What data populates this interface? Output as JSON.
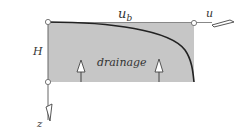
{
  "diagram": {
    "labels": {
      "top_velocity": "u",
      "top_velocity_subscript": "b",
      "horizontal_axis": "u",
      "height": "H",
      "region": "drainage",
      "vertical_axis": "z"
    },
    "colors": {
      "fill": "#c6c6c6",
      "stroke": "#222222",
      "thin_line": "#555555",
      "text": "#333333"
    },
    "arrows": [
      {
        "name": "drainage-arrow-left",
        "direction": "up"
      },
      {
        "name": "drainage-arrow-right",
        "direction": "up"
      }
    ]
  }
}
